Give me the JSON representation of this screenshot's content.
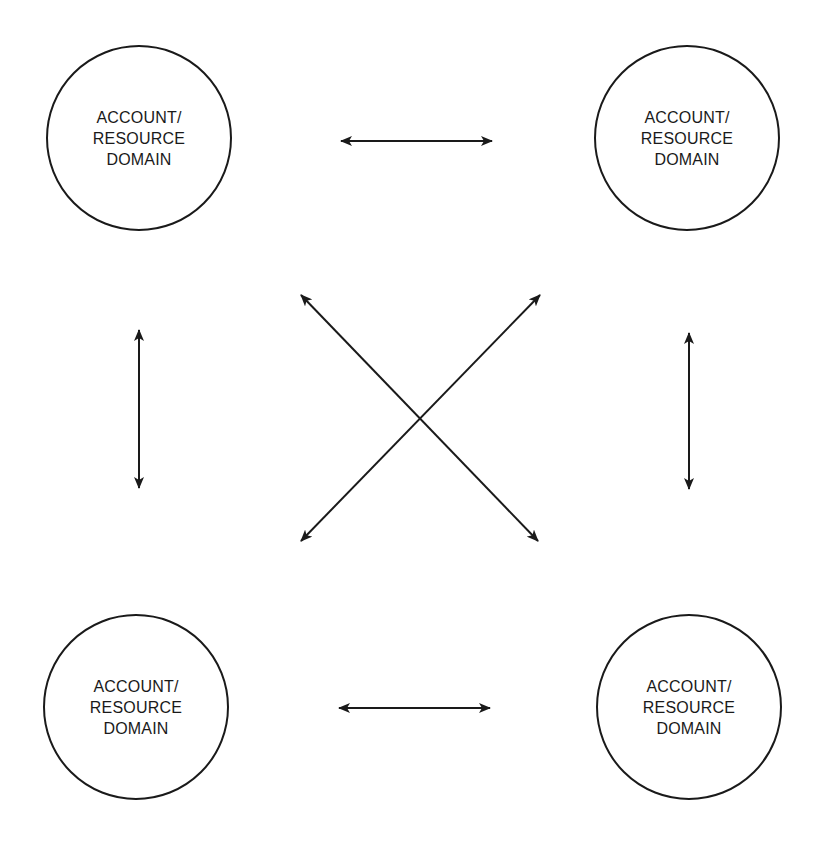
{
  "nodes": [
    {
      "id": "top-left",
      "line1": "ACCOUNT/",
      "line2": "RESOURCE",
      "line3": "DOMAIN"
    },
    {
      "id": "top-right",
      "line1": "ACCOUNT/",
      "line2": "RESOURCE",
      "line3": "DOMAIN"
    },
    {
      "id": "bottom-left",
      "line1": "ACCOUNT/",
      "line2": "RESOURCE",
      "line3": "DOMAIN"
    },
    {
      "id": "bottom-right",
      "line1": "ACCOUNT/",
      "line2": "RESOURCE",
      "line3": "DOMAIN"
    }
  ],
  "connections": [
    {
      "from": "top-left",
      "to": "top-right",
      "type": "bidirectional"
    },
    {
      "from": "bottom-left",
      "to": "bottom-right",
      "type": "bidirectional"
    },
    {
      "from": "top-left",
      "to": "bottom-left",
      "type": "bidirectional"
    },
    {
      "from": "top-right",
      "to": "bottom-right",
      "type": "bidirectional"
    },
    {
      "from": "top-left",
      "to": "bottom-right",
      "type": "bidirectional"
    },
    {
      "from": "top-right",
      "to": "bottom-left",
      "type": "bidirectional"
    }
  ],
  "colors": {
    "stroke": "#1a1a1a",
    "background": "#ffffff"
  }
}
